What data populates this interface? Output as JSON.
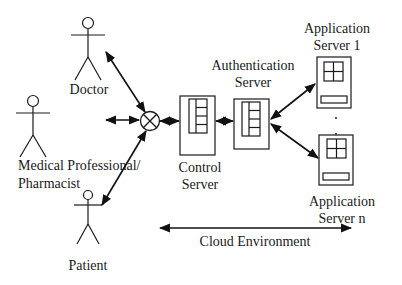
{
  "diagram": {
    "actors": [
      {
        "id": "doctor",
        "label": "Doctor"
      },
      {
        "id": "medical-professional",
        "label_line1": "Medical Professional/",
        "label_line2": "Pharmacist"
      },
      {
        "id": "patient",
        "label": "Patient"
      }
    ],
    "servers": {
      "control": {
        "label_line1": "Control",
        "label_line2": "Server"
      },
      "authentication": {
        "label_line1": "Authentication",
        "label_line2": "Server"
      },
      "app1": {
        "label_line1": "Application",
        "label_line2": "Server 1"
      },
      "appn": {
        "label_line1": "Application",
        "label_line2": "Server n"
      }
    },
    "ellipsis": ". .",
    "cloud": {
      "label": "Cloud Environment"
    },
    "icons": {
      "actor": "stick-figure-icon",
      "mixer": "circle-x-junction-icon",
      "server": "server-rack-icon"
    },
    "colors": {
      "line": "#1a1a1a",
      "background": "#ffffff"
    }
  }
}
